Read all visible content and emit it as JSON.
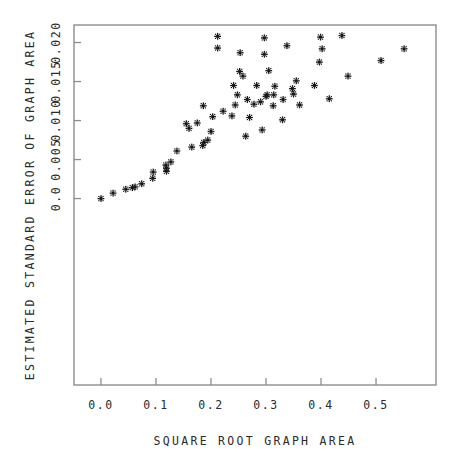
{
  "chart_data": {
    "type": "scatter",
    "title": "",
    "xlabel": "SQUARE ROOT GRAPH AREA",
    "ylabel": "ESTIMATED STANDARD ERROR OF GRAPH AREA",
    "xlim": [
      -0.049,
      0.609
    ],
    "ylim": [
      -0.0239,
      0.02225
    ],
    "xticks": [
      0.0,
      0.1,
      0.2,
      0.3,
      0.4,
      0.5
    ],
    "xticklabels": [
      "0.0",
      "0.1",
      "0.2",
      "0.3",
      "0.4",
      "0.5"
    ],
    "yticks": [
      0.0,
      0.005,
      0.01,
      0.015,
      0.02
    ],
    "yticklabels": [
      "0.0",
      "0.005",
      "0.010",
      "0.015",
      "0.020"
    ],
    "grid": false,
    "legend": null,
    "marker": "asterisk",
    "marker_color": "#151515",
    "frame_color": "#8d8d8d",
    "n_points": 60,
    "points": [
      [
        0.0,
        0.0
      ],
      [
        0.022,
        0.0007
      ],
      [
        0.045,
        0.0012
      ],
      [
        0.057,
        0.0014
      ],
      [
        0.062,
        0.0015
      ],
      [
        0.074,
        0.0019
      ],
      [
        0.094,
        0.0026
      ],
      [
        0.095,
        0.0034
      ],
      [
        0.119,
        0.0035
      ],
      [
        0.119,
        0.0039
      ],
      [
        0.118,
        0.0043
      ],
      [
        0.127,
        0.0047
      ],
      [
        0.138,
        0.0061
      ],
      [
        0.165,
        0.0066
      ],
      [
        0.185,
        0.0068
      ],
      [
        0.187,
        0.0072
      ],
      [
        0.194,
        0.0075
      ],
      [
        0.2,
        0.0086
      ],
      [
        0.16,
        0.009
      ],
      [
        0.155,
        0.0096
      ],
      [
        0.263,
        0.008
      ],
      [
        0.293,
        0.0088
      ],
      [
        0.175,
        0.0097
      ],
      [
        0.203,
        0.0105
      ],
      [
        0.222,
        0.0112
      ],
      [
        0.238,
        0.0106
      ],
      [
        0.27,
        0.0104
      ],
      [
        0.33,
        0.0101
      ],
      [
        0.186,
        0.0119
      ],
      [
        0.244,
        0.012
      ],
      [
        0.278,
        0.0121
      ],
      [
        0.313,
        0.0119
      ],
      [
        0.331,
        0.0127
      ],
      [
        0.361,
        0.012
      ],
      [
        0.3,
        0.0131
      ],
      [
        0.302,
        0.0133
      ],
      [
        0.314,
        0.0133
      ],
      [
        0.248,
        0.0133
      ],
      [
        0.266,
        0.0127
      ],
      [
        0.29,
        0.0124
      ],
      [
        0.35,
        0.0134
      ],
      [
        0.348,
        0.0141
      ],
      [
        0.415,
        0.0128
      ],
      [
        0.241,
        0.0145
      ],
      [
        0.283,
        0.0145
      ],
      [
        0.316,
        0.0144
      ],
      [
        0.355,
        0.0151
      ],
      [
        0.258,
        0.0157
      ],
      [
        0.388,
        0.0145
      ],
      [
        0.252,
        0.0163
      ],
      [
        0.305,
        0.0164
      ],
      [
        0.449,
        0.0157
      ],
      [
        0.397,
        0.0175
      ],
      [
        0.509,
        0.0177
      ],
      [
        0.212,
        0.0193
      ],
      [
        0.253,
        0.0187
      ],
      [
        0.297,
        0.0185
      ],
      [
        0.402,
        0.0192
      ],
      [
        0.551,
        0.0192
      ],
      [
        0.338,
        0.0196
      ],
      [
        0.399,
        0.0207
      ],
      [
        0.212,
        0.0208
      ],
      [
        0.297,
        0.0206
      ],
      [
        0.438,
        0.0209
      ]
    ]
  },
  "axes": {
    "x_title": "SQUARE ROOT GRAPH AREA",
    "y_title": "ESTIMATED STANDARD ERROR OF GRAPH AREA"
  }
}
